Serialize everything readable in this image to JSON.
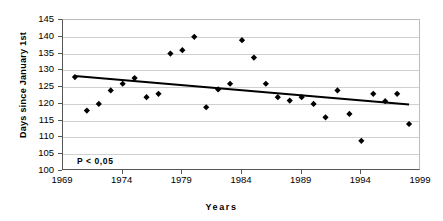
{
  "chart_data": {
    "type": "scatter",
    "title": "",
    "xlabel": "Years",
    "ylabel": "Days since January 1st",
    "xlim": [
      1969,
      1999
    ],
    "ylim": [
      100,
      145
    ],
    "xticks": [
      1969,
      1974,
      1979,
      1984,
      1989,
      1994,
      1999
    ],
    "yticks": [
      100,
      105,
      110,
      115,
      120,
      125,
      130,
      135,
      140,
      145
    ],
    "grid": "horizontal",
    "legend": "none",
    "annotations": [
      {
        "text": "P < 0,05",
        "x": 1970,
        "y": 102
      }
    ],
    "x": [
      1970,
      1971,
      1972,
      1973,
      1974,
      1975,
      1976,
      1977,
      1978,
      1979,
      1980,
      1981,
      1982,
      1983,
      1984,
      1985,
      1986,
      1987,
      1988,
      1989,
      1990,
      1991,
      1992,
      1993,
      1994,
      1995,
      1996,
      1997
    ],
    "y": [
      128,
      118,
      120,
      124,
      126,
      127.7,
      122,
      123,
      135,
      136,
      140,
      119,
      124.3,
      126,
      139,
      133.8,
      126,
      122,
      121,
      122,
      120,
      116,
      124,
      117,
      109,
      123,
      120.8,
      123
    ],
    "points": [
      {
        "year": 1970,
        "value": 128
      },
      {
        "year": 1971,
        "value": 118
      },
      {
        "year": 1972,
        "value": 120
      },
      {
        "year": 1973,
        "value": 124
      },
      {
        "year": 1974,
        "value": 126
      },
      {
        "year": 1975,
        "value": 127.7
      },
      {
        "year": 1976,
        "value": 122
      },
      {
        "year": 1977,
        "value": 123
      },
      {
        "year": 1978,
        "value": 135
      },
      {
        "year": 1979,
        "value": 136
      },
      {
        "year": 1980,
        "value": 140
      },
      {
        "year": 1981,
        "value": 119
      },
      {
        "year": 1982,
        "value": 124.3
      },
      {
        "year": 1983,
        "value": 126
      },
      {
        "year": 1984,
        "value": 139
      },
      {
        "year": 1985,
        "value": 133.8
      },
      {
        "year": 1986,
        "value": 126
      },
      {
        "year": 1987,
        "value": 122
      },
      {
        "year": 1988,
        "value": 121
      },
      {
        "year": 1989,
        "value": 122
      },
      {
        "year": 1990,
        "value": 120
      },
      {
        "year": 1991,
        "value": 116
      },
      {
        "year": 1992,
        "value": 124
      },
      {
        "year": 1993,
        "value": 117
      },
      {
        "year": 1994,
        "value": 109
      },
      {
        "year": 1995,
        "value": 123
      },
      {
        "year": 1996,
        "value": 120.8
      },
      {
        "year": 1997,
        "value": 123
      },
      {
        "year": 1998,
        "value": 114
      }
    ],
    "trendline": {
      "x0": 1970,
      "y0": 128.3,
      "x1": 1998,
      "y1": 119.8
    },
    "series": [
      {
        "name": "Days since January 1st",
        "marker": "diamond",
        "color": "#000000"
      }
    ]
  },
  "colors": {
    "marker": "#000000",
    "trend": "#000000",
    "grid": "#d0d0d0",
    "axis": "#555555",
    "background": "#ffffff"
  }
}
